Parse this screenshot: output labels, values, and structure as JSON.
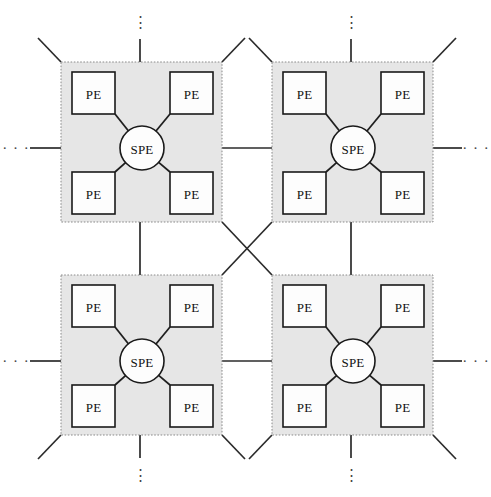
{
  "diagram": {
    "type": "node-link-diagram",
    "canvas": {
      "width": 491,
      "height": 497
    },
    "colors": {
      "cluster_fill": "#e6e6e6",
      "cluster_border": "#8a8a8a",
      "node_fill": "#fdfdfd",
      "node_stroke": "#1a1a1a",
      "link_stroke": "#2b2b2b",
      "background": "#ffffff"
    },
    "labels": {
      "pe": "PE",
      "spe": "SPE",
      "ellipsis_horizontal": "· · ·",
      "ellipsis_vertical": "⋮"
    },
    "clusters": [
      {
        "id": "cluster-top-left",
        "x": 61,
        "y": 62,
        "w": 161,
        "h": 160,
        "spe": {
          "label": "SPE",
          "cx": 142,
          "cy": 148,
          "r": 22
        },
        "pes": [
          {
            "label": "PE",
            "position": "top-left",
            "x": 72,
            "y": 72,
            "w": 43,
            "h": 42
          },
          {
            "label": "PE",
            "position": "top-right",
            "x": 170,
            "y": 72,
            "w": 43,
            "h": 42
          },
          {
            "label": "PE",
            "position": "bottom-left",
            "x": 72,
            "y": 172,
            "w": 43,
            "h": 42
          },
          {
            "label": "PE",
            "position": "bottom-right",
            "x": 170,
            "y": 172,
            "w": 43,
            "h": 42
          }
        ]
      },
      {
        "id": "cluster-top-right",
        "x": 272,
        "y": 62,
        "w": 161,
        "h": 160,
        "spe": {
          "label": "SPE",
          "cx": 353,
          "cy": 148,
          "r": 22
        },
        "pes": [
          {
            "label": "PE",
            "position": "top-left",
            "x": 283,
            "y": 72,
            "w": 43,
            "h": 42
          },
          {
            "label": "PE",
            "position": "top-right",
            "x": 381,
            "y": 72,
            "w": 43,
            "h": 42
          },
          {
            "label": "PE",
            "position": "bottom-left",
            "x": 283,
            "y": 172,
            "w": 43,
            "h": 42
          },
          {
            "label": "PE",
            "position": "bottom-right",
            "x": 381,
            "y": 172,
            "w": 43,
            "h": 42
          }
        ]
      },
      {
        "id": "cluster-bottom-left",
        "x": 61,
        "y": 275,
        "w": 161,
        "h": 160,
        "spe": {
          "label": "SPE",
          "cx": 142,
          "cy": 361,
          "r": 22
        },
        "pes": [
          {
            "label": "PE",
            "position": "top-left",
            "x": 72,
            "y": 285,
            "w": 43,
            "h": 42
          },
          {
            "label": "PE",
            "position": "top-right",
            "x": 170,
            "y": 285,
            "w": 43,
            "h": 42
          },
          {
            "label": "PE",
            "position": "bottom-left",
            "x": 72,
            "y": 385,
            "w": 43,
            "h": 42
          },
          {
            "label": "PE",
            "position": "bottom-right",
            "x": 170,
            "y": 385,
            "w": 43,
            "h": 42
          }
        ]
      },
      {
        "id": "cluster-bottom-right",
        "x": 272,
        "y": 275,
        "w": 161,
        "h": 160,
        "spe": {
          "label": "SPE",
          "cx": 353,
          "cy": 361,
          "r": 22
        },
        "pes": [
          {
            "label": "PE",
            "position": "top-left",
            "x": 283,
            "y": 285,
            "w": 43,
            "h": 42
          },
          {
            "label": "PE",
            "position": "top-right",
            "x": 381,
            "y": 285,
            "w": 43,
            "h": 42
          },
          {
            "label": "PE",
            "position": "bottom-left",
            "x": 283,
            "y": 385,
            "w": 43,
            "h": 42
          },
          {
            "label": "PE",
            "position": "bottom-right",
            "x": 381,
            "y": 385,
            "w": 43,
            "h": 42
          }
        ]
      }
    ],
    "ellipses": [
      {
        "id": "ellipsis-top-left",
        "kind": "vertical",
        "text": "⋮",
        "x": 140,
        "y": 22
      },
      {
        "id": "ellipsis-top-right",
        "kind": "vertical",
        "text": "⋮",
        "x": 351,
        "y": 22
      },
      {
        "id": "ellipsis-bottom-left",
        "kind": "vertical",
        "text": "⋮",
        "x": 140,
        "y": 475
      },
      {
        "id": "ellipsis-bottom-right",
        "kind": "vertical",
        "text": "⋮",
        "x": 351,
        "y": 475
      },
      {
        "id": "ellipsis-left-top",
        "kind": "horizontal",
        "text": "· · ·",
        "x": 16,
        "y": 148
      },
      {
        "id": "ellipsis-left-bottom",
        "kind": "horizontal",
        "text": "· · ·",
        "x": 16,
        "y": 361
      },
      {
        "id": "ellipsis-right-top",
        "kind": "horizontal",
        "text": "· · ·",
        "x": 476,
        "y": 148
      },
      {
        "id": "ellipsis-right-bottom",
        "kind": "horizontal",
        "text": "· · ·",
        "x": 476,
        "y": 361
      }
    ]
  }
}
